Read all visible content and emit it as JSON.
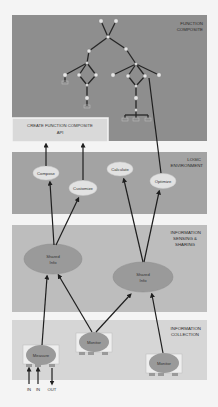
{
  "layers": {
    "function_composite": {
      "label_line1": "FUNCTION",
      "label_line2": "COMPOSITE"
    },
    "api_box": {
      "line1": "CREATE FUNCTION COMPOSITE",
      "line2": "API"
    },
    "logic_environment": {
      "label_line1": "LOGIC",
      "label_line2": "ENVIRONMENT"
    },
    "information_sensing": {
      "label_line1": "INFORMATION",
      "label_line2": "SENSING &",
      "label_line3": "SHARING"
    },
    "information_collection": {
      "label_line1": "INFORMATION",
      "label_line2": "COLLECTION"
    }
  },
  "logic_nodes": [
    {
      "label": "Compose"
    },
    {
      "label": "Customize"
    },
    {
      "label": "Calculate"
    },
    {
      "label": "Optimize"
    }
  ],
  "shared_info_nodes": [
    {
      "line1": "Shared",
      "line2": "Info"
    },
    {
      "line1": "Shared",
      "line2": "Info"
    }
  ],
  "collection_nodes": [
    {
      "label": "Measure"
    },
    {
      "label": "Monitor"
    },
    {
      "label": "Monitor"
    }
  ],
  "io_labels": [
    "IN",
    "IN",
    "OUT"
  ],
  "colors": {
    "function_panel": "#8e8e8e",
    "api_box": "#d9d9d9",
    "logic_panel": "#a3a3a3",
    "sensing_panel": "#bdbdbd",
    "collection_panel": "#d6d6d6",
    "ellipse_light": "#e2e2e2",
    "ellipse_dark": "#9a9a9a",
    "arrow": "#1e1e1e"
  }
}
